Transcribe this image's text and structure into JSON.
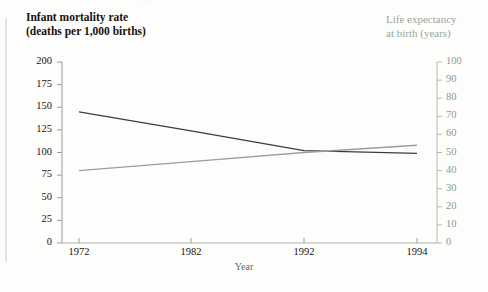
{
  "page": {
    "top_fragment": "··"
  },
  "chart_data": {
    "type": "line",
    "title": "",
    "xlabel": "Year",
    "x": [
      1972,
      1982,
      1992,
      1994
    ],
    "xticklabels": [
      "1972",
      "1982",
      "1992",
      "1994"
    ],
    "grid": false,
    "legend": "none",
    "axes": {
      "left": {
        "label_line1": "Infant mortality rate",
        "label_line2": "(deaths per 1,000 births)",
        "ylim": [
          0,
          200
        ],
        "ticks": [
          0,
          25,
          50,
          75,
          100,
          125,
          150,
          175,
          200
        ],
        "ticklabels": [
          "0",
          "25",
          "50",
          "75",
          "100",
          "125",
          "150",
          "175",
          "200"
        ],
        "color": "#16110f"
      },
      "right": {
        "label_line1": "Life expectancy",
        "label_line2": "at birth (years)",
        "ylim": [
          0,
          100
        ],
        "ticks": [
          0,
          10,
          20,
          30,
          40,
          50,
          60,
          70,
          80,
          90,
          100
        ],
        "ticklabels": [
          "0",
          "10",
          "20",
          "30",
          "40",
          "50",
          "60",
          "70",
          "80",
          "90",
          "100"
        ],
        "color": "#9aa79a"
      }
    },
    "series": [
      {
        "name": "Infant mortality rate",
        "axis": "left",
        "color": "#3d3d3d",
        "values": [
          145,
          124,
          102,
          99
        ]
      },
      {
        "name": "Life expectancy at birth",
        "axis": "right",
        "color": "#9d9d9d",
        "values": [
          40,
          45,
          50,
          54
        ]
      }
    ]
  }
}
